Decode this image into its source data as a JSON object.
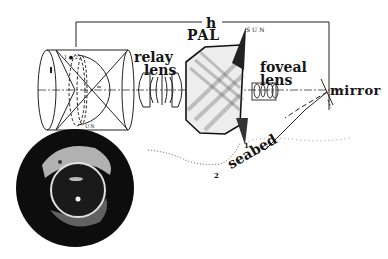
{
  "diagram": {
    "labels": {
      "h": "h",
      "pal": "PAL",
      "sun_top": "SUN",
      "relay": "relay",
      "relay_lens": "lens",
      "foveal": "foveal",
      "foveal_lens": "lens",
      "mirror": "mirror",
      "seabed": "seabed",
      "marker_1": "1",
      "marker_2": "2",
      "sun_bottom": "UN",
      "small_top": "1 ● 2"
    },
    "components": [
      "eye-cylinder-model",
      "relay-lens",
      "PAL",
      "foveal-lens",
      "mirror",
      "seabed",
      "panoramic-image-photo"
    ],
    "colors": {
      "ink": "#151515",
      "background": "#ffffff",
      "photo_dark": "#0d0d0d"
    }
  }
}
